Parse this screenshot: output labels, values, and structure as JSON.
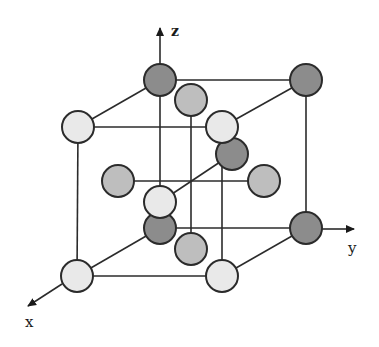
{
  "figure": {
    "type": "crystal-unit-cell"
  },
  "axes": {
    "x": {
      "label": "x"
    },
    "y": {
      "label": "y"
    },
    "z": {
      "label": "z"
    }
  },
  "colors": {
    "line": "#2b2b2b",
    "atom_dark": "#8c8c8c",
    "atom_grey": "#bebebe",
    "atom_light": "#e9e9e9",
    "background": "#ffffff"
  },
  "atoms": [
    {
      "id": "back-top-left",
      "kind": "dark",
      "cx": 160,
      "cy": 80
    },
    {
      "id": "back-top-right",
      "kind": "dark",
      "cx": 306,
      "cy": 80
    },
    {
      "id": "back-bottom-left",
      "kind": "dark",
      "cx": 160,
      "cy": 228
    },
    {
      "id": "back-bottom-right",
      "kind": "dark",
      "cx": 306,
      "cy": 228
    },
    {
      "id": "body-center",
      "kind": "dark",
      "cx": 232,
      "cy": 154
    },
    {
      "id": "top-face",
      "kind": "grey",
      "cx": 191,
      "cy": 100
    },
    {
      "id": "left-face",
      "kind": "grey",
      "cx": 118,
      "cy": 181
    },
    {
      "id": "right-face",
      "kind": "grey",
      "cx": 264,
      "cy": 181
    },
    {
      "id": "bottom-face",
      "kind": "grey",
      "cx": 191,
      "cy": 249
    },
    {
      "id": "front-top-left",
      "kind": "light",
      "cx": 78,
      "cy": 127
    },
    {
      "id": "front-top-right",
      "kind": "light",
      "cx": 222,
      "cy": 127
    },
    {
      "id": "front-bottom-left",
      "kind": "light",
      "cx": 77,
      "cy": 276
    },
    {
      "id": "front-bottom-right",
      "kind": "light",
      "cx": 222,
      "cy": 276
    },
    {
      "id": "front-face",
      "kind": "light",
      "cx": 160,
      "cy": 202
    }
  ]
}
